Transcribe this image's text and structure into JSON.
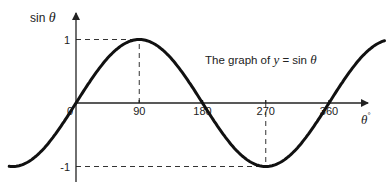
{
  "chart_data": {
    "type": "line",
    "title": "The graph of y = sin θ",
    "title_parts": {
      "prefix": "The graph of ",
      "y": "y",
      "eq": " = sin ",
      "theta": "θ"
    },
    "xlabel": "θ°",
    "ylabel": "sin θ",
    "x_ticks": [
      0,
      90,
      180,
      270,
      360
    ],
    "x_tick_labels": [
      "0",
      "90",
      "180",
      "270",
      "360"
    ],
    "y_ticks": [
      1,
      -1
    ],
    "y_tick_labels": [
      "1",
      "-1"
    ],
    "xlim": [
      -95,
      440
    ],
    "ylim": [
      -1,
      1
    ],
    "grid": false,
    "annotations": [
      {
        "type": "dashed-guide",
        "x": 90,
        "y": 1
      },
      {
        "type": "dashed-guide",
        "x": 270,
        "y": -1
      }
    ],
    "series": [
      {
        "name": "y = sin θ",
        "x": [
          -90,
          -45,
          0,
          45,
          90,
          135,
          180,
          225,
          270,
          315,
          360,
          405,
          440
        ],
        "values": [
          -1,
          -0.707,
          0,
          0.707,
          1,
          0.707,
          0,
          -0.707,
          -1,
          -0.707,
          0,
          0.707,
          0.94
        ]
      }
    ]
  },
  "labels": {
    "ylabel_text": "sin ",
    "ylabel_theta": "θ",
    "xlabel_theta": "θ",
    "xlabel_deg": "°"
  }
}
